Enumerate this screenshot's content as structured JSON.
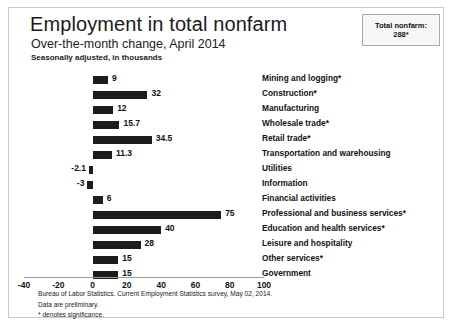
{
  "header": {
    "title": "Employment in total nonfarm",
    "subtitle": "Over-the-month change, April 2014",
    "seasonal_note": "Seasonally adjusted, in thousands"
  },
  "badge": {
    "line1": "Total nonfarm:",
    "line2": "288*"
  },
  "footnotes": {
    "source": "Bureau of Labor Statistics. Current Employment Statistics survey, May 02, 2014.",
    "preliminary": "Data are preliminary.",
    "significance": "* denotes significance."
  },
  "colors": {
    "bar": "#1c1c1c",
    "border": "#c9c9c9",
    "axis": "#9a9a9a",
    "badge_bg": "#f6f6f6"
  },
  "chart_data": {
    "type": "bar",
    "orientation": "horizontal",
    "title": "Employment in total nonfarm",
    "subtitle": "Over-the-month change, April 2014",
    "xlabel": "",
    "ylabel": "",
    "units": "thousands",
    "xlim": [
      -40,
      100
    ],
    "xticks": [
      -40,
      -20,
      0,
      20,
      40,
      60,
      80,
      100
    ],
    "grid": false,
    "legend": false,
    "categories": [
      "Mining and logging*",
      "Construction*",
      "Manufacturing",
      "Wholesale trade*",
      "Retail trade*",
      "Transportation and warehousing",
      "Utilities",
      "Information",
      "Financial activities",
      "Professional and business services*",
      "Education and health services*",
      "Leisure and hospitality",
      "Other services*",
      "Government"
    ],
    "values": [
      9,
      32,
      12,
      15.7,
      34.5,
      11.3,
      -2.1,
      -3,
      6,
      75,
      40,
      28,
      15,
      15
    ],
    "value_labels": [
      "9",
      "32",
      "12",
      "15.7",
      "34.5",
      "11.3",
      "-2.1",
      "-3",
      "6",
      "75",
      "40",
      "28",
      "15",
      "15"
    ]
  }
}
